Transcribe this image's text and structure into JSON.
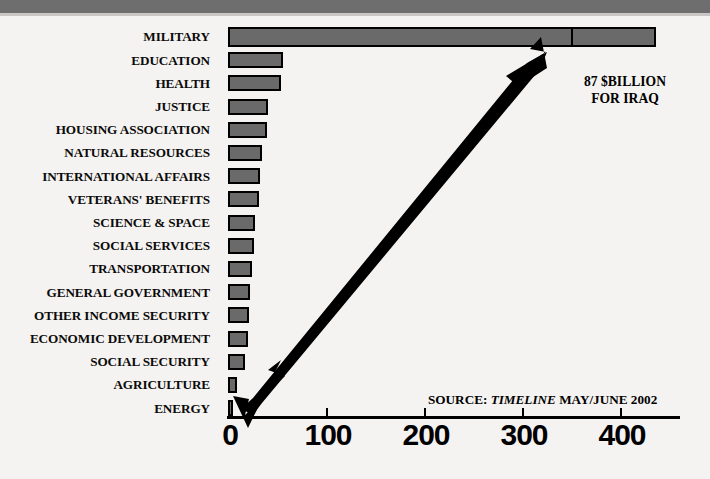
{
  "chart_data": {
    "type": "bar",
    "orientation": "horizontal",
    "title": "",
    "subtitle": "",
    "xlabel": "",
    "ylabel": "",
    "xlim": [
      0,
      462
    ],
    "xticks": [
      0,
      100,
      200,
      300,
      400
    ],
    "xtick_labels": [
      "0",
      "100",
      "200",
      "300",
      "400"
    ],
    "grid": false,
    "legend": "none",
    "units": "$ Billion",
    "categories": [
      "MILITARY",
      "EDUCATION",
      "HEALTH",
      "JUSTICE",
      "HOUSING ASSOCIATION",
      "NATURAL RESOURCES",
      "INTERNATIONAL AFFAIRS",
      "VETERANS' BENEFITS",
      "SCIENCE & SPACE",
      "SOCIAL SERVICES",
      "TRANSPORTATION",
      "GENERAL GOVERNMENT",
      "OTHER INCOME SECURITY",
      "ECONOMIC DEVELOPMENT",
      "SOCIAL SECURITY",
      "AGRICULTURE",
      "ENERGY"
    ],
    "values": [
      437,
      56,
      54,
      41,
      40,
      35,
      33,
      32,
      28,
      27,
      24,
      22,
      21,
      20,
      17,
      9,
      3
    ],
    "segments": {
      "MILITARY": {
        "base": 350,
        "supplement": 87,
        "supplement_label": "87 $BILLION FOR IRAQ"
      }
    },
    "annotations": [
      {
        "name": "iraq-callout",
        "line1": "87 $BILLION",
        "line2": "FOR IRAQ",
        "points_to": "MILITARY supplemental segment"
      },
      {
        "name": "source-note",
        "prefix": "SOURCE: ",
        "italic": "TIMELINE",
        "suffix": " MAY/JUNE 2002"
      },
      {
        "name": "callout-arrow",
        "shape": "double-headed-diagonal-arrow"
      }
    ],
    "colors": {
      "bar_fill": "#6a6a6a",
      "bar_outline": "#000000",
      "background": "#f5f3f1",
      "top_band": "#6e6e6e",
      "text": "#000000"
    }
  },
  "axis": {
    "ticks": [
      {
        "value": "0",
        "x": 228
      },
      {
        "value": "100",
        "x": 326
      },
      {
        "value": "200",
        "x": 424
      },
      {
        "value": "300",
        "x": 522
      },
      {
        "value": "400",
        "x": 620
      }
    ]
  },
  "annotations": {
    "iraq_line1": "87 $BILLION",
    "iraq_line2": "FOR IRAQ",
    "source_prefix": "SOURCE: ",
    "source_italic": "TIMELINE",
    "source_suffix": " MAY/JUNE 2002"
  }
}
